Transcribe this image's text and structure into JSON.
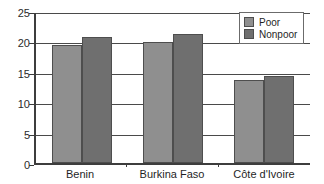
{
  "chart_data": {
    "type": "bar",
    "title": "",
    "subtitle": "",
    "xlabel": "",
    "ylabel": "",
    "categories": [
      "Benin",
      "Burkina Faso",
      "Côte d'Ivoire"
    ],
    "series": [
      {
        "name": "Poor",
        "color": "#8f8f8f",
        "values": [
          19.7,
          20.1,
          13.6
        ]
      },
      {
        "name": "Nonpoor",
        "color": "#6f6f6f",
        "values": [
          21.0,
          21.5,
          14.3
        ]
      }
    ],
    "ylim": [
      0,
      25
    ],
    "ytick_values": [
      0,
      5,
      10,
      15,
      20,
      25
    ],
    "ytick_labels": [
      "0",
      "5",
      "10",
      "15",
      "20",
      "25"
    ],
    "grid": true,
    "grid_axis": "y",
    "legend_position": "top-right",
    "legend_entries": [
      "Poor",
      "Nonpoor"
    ]
  },
  "axes": {
    "y": {
      "ticks": [
        {
          "label": "25",
          "value": 25
        },
        {
          "label": "20",
          "value": 20
        },
        {
          "label": "15",
          "value": 15
        },
        {
          "label": "10",
          "value": 10
        },
        {
          "label": "5",
          "value": 5
        },
        {
          "label": "0",
          "value": 0
        }
      ]
    },
    "x": {
      "ticks": [
        {
          "label": "Benin"
        },
        {
          "label": "Burkina Faso"
        },
        {
          "label": "Côte d'Ivoire"
        }
      ]
    }
  },
  "legend": {
    "items": [
      {
        "label": "Poor",
        "color": "#8f8f8f"
      },
      {
        "label": "Nonpoor",
        "color": "#6f6f6f"
      }
    ]
  }
}
